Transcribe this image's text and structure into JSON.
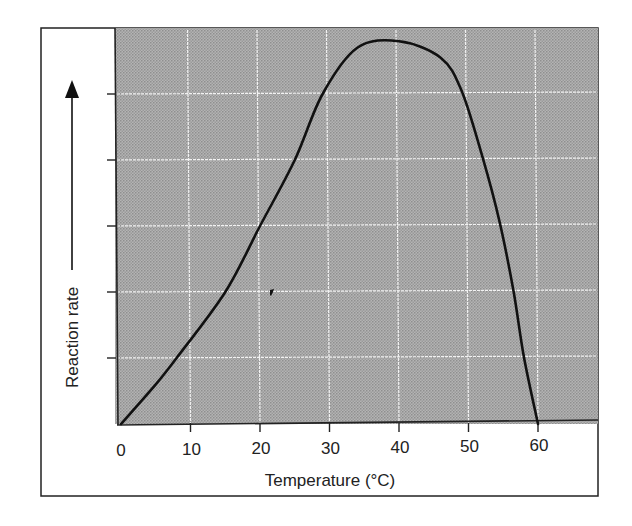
{
  "chart_data": {
    "type": "line",
    "title": "",
    "xlabel": "Temperature (°C)",
    "ylabel": "Reaction rate",
    "xlim": [
      0,
      68
    ],
    "ylim": [
      0,
      6.5
    ],
    "x_ticks": [
      "0",
      "10",
      "20",
      "30",
      "40",
      "50",
      "60"
    ],
    "y_ticks_labeled": false,
    "y_tick_count": 5,
    "grid": true,
    "legend": null,
    "series": [
      {
        "name": "Enzyme reaction rate",
        "x": [
          0,
          5,
          8,
          15,
          20,
          25,
          29,
          34,
          40,
          46,
          49,
          52,
          54.5,
          56.5,
          58,
          60
        ],
        "y": [
          0,
          0.6,
          1.0,
          2.0,
          3.0,
          4.0,
          5.0,
          5.7,
          5.8,
          5.55,
          5.05,
          4.05,
          3.05,
          2.0,
          1.0,
          0
        ]
      }
    ],
    "annotations": [
      {
        "text": "arrow pointing up alongside y-axis label",
        "meaning": "increasing reaction rate"
      }
    ],
    "colors": {
      "plot_background": "#a9a9a9",
      "grid": "#f2f2f2",
      "curve": "#111111",
      "frame": "#222222"
    }
  }
}
